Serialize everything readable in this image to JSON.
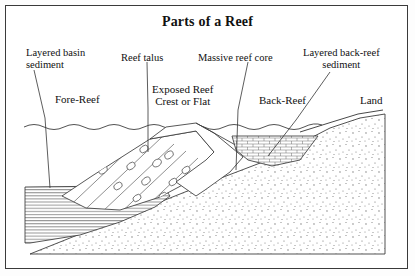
{
  "title": "Parts of a Reef",
  "callouts": [
    {
      "name": "layered-basin-sediment",
      "text": "Layered basin\nsediment",
      "x": 26,
      "y": 47
    },
    {
      "name": "reef-talus",
      "text": "Reef talus",
      "x": 121,
      "y": 52
    },
    {
      "name": "massive-reef-core",
      "text": "Massive reef core",
      "x": 198,
      "y": 52
    },
    {
      "name": "layered-back-reef-sediment",
      "text": "Layered back-reef\nsediment",
      "x": 303,
      "y": 47
    }
  ],
  "zones": [
    {
      "name": "fore-reef",
      "text": "Fore-Reef",
      "x": 55,
      "y": 93
    },
    {
      "name": "exposed-reef-crest",
      "text": "Exposed Reef\nCrest or Flat",
      "x": 152,
      "y": 83
    },
    {
      "name": "back-reef",
      "text": "Back-Reef",
      "x": 259,
      "y": 94
    },
    {
      "name": "land",
      "text": "Land",
      "x": 360,
      "y": 94
    }
  ],
  "features": {
    "water_surface": "wavy-sea-level-line",
    "basin_sediment_fill": "horizontal-layers",
    "talus_fill": "diagonal-bands-with-clasts",
    "reef_core_fill": "blank-white",
    "back_reef_fill": "brick-pattern",
    "basement_fill": "stipple-dots"
  },
  "colors": {
    "ink": "#222222",
    "border": "#3a3a3a",
    "background": "#ffffff",
    "layer_line": "#555555",
    "brick_line": "#666666",
    "stipple": "#777777"
  }
}
